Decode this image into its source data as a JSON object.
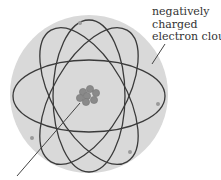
{
  "diagram": {
    "type": "atom-model",
    "labels": {
      "electron_cloud": [
        "negatively",
        "charged",
        "electron cloud"
      ]
    },
    "colors": {
      "cloud": "#d9d9d9",
      "orbit": "#3a3a3a",
      "nucleus": "#8a8a8a",
      "electron": "#9a9a9a",
      "text": "#333333"
    }
  }
}
